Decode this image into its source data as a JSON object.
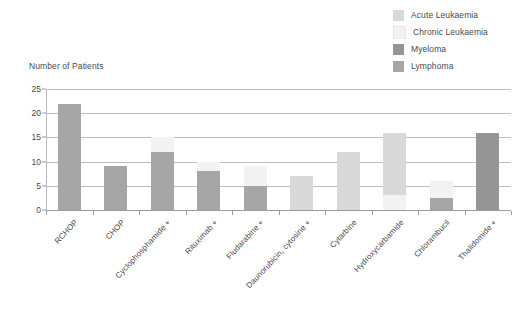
{
  "chart": {
    "title": "Number of Patients"
  },
  "legend": {
    "position": "top-right",
    "items": [
      {
        "label": "Acute Leukaemia",
        "color": "#d9d9d9"
      },
      {
        "label": "Chronic Leukaemia",
        "color": "#f2f2f2"
      },
      {
        "label": "Myeloma",
        "color": "#959595"
      },
      {
        "label": "Lymphoma",
        "color": "#a6a6a6"
      }
    ]
  },
  "chart_data": {
    "type": "bar",
    "subtype": "stacked",
    "title": "Number of Patients",
    "xlabel": "",
    "ylabel": "Number of Patients",
    "ylim": [
      0,
      25
    ],
    "yticks": [
      0,
      5,
      10,
      15,
      20,
      25
    ],
    "ytick_labels": [
      "0",
      "5",
      "10",
      "15",
      "20",
      "25"
    ],
    "grid": true,
    "legend_position": "top right",
    "categories": [
      "RCHOP",
      "CHOP",
      "Cyclophosphamide +",
      "Rituximab +",
      "Fludarabine +",
      "Daunorubicin, cytosine +",
      "Cytarbine",
      "Hydroxycarbamide",
      "Chlorambucil",
      "Thalidomide +"
    ],
    "series": [
      {
        "name": "Lymphoma",
        "color": "#a6a6a6",
        "values": [
          22,
          9,
          12,
          8,
          5,
          0,
          0,
          0,
          2.5,
          0
        ]
      },
      {
        "name": "Myeloma",
        "color": "#959595",
        "values": [
          0,
          0,
          0,
          0,
          0,
          0,
          0,
          0,
          0,
          16
        ]
      },
      {
        "name": "Chronic Leukaemia",
        "color": "#f2f2f2",
        "values": [
          0,
          0,
          3,
          2,
          4,
          0,
          0,
          3,
          3.5,
          0
        ]
      },
      {
        "name": "Acute Leukaemia",
        "color": "#d9d9d9",
        "values": [
          0,
          0,
          0,
          0,
          0,
          7,
          12,
          13,
          0,
          0
        ]
      }
    ],
    "totals": [
      22,
      9,
      15,
      10,
      9,
      7,
      12,
      16,
      6,
      16
    ]
  }
}
